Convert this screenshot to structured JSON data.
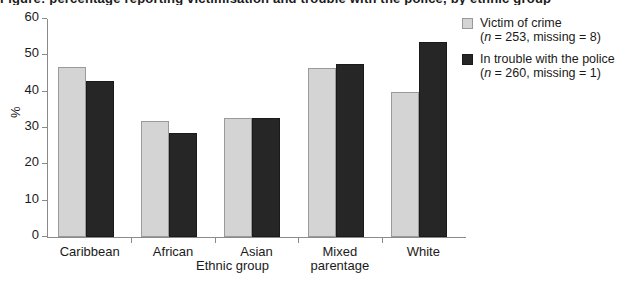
{
  "title_crop": "Figure: percentage reporting victimisation and trouble with the police, by ethnic group",
  "chart_data": {
    "type": "bar",
    "title": "",
    "xlabel": "Ethnic group",
    "ylabel": "%",
    "ylim": [
      0,
      60
    ],
    "yticks": [
      0,
      10,
      20,
      30,
      40,
      50,
      60
    ],
    "ytick_labels": [
      "0",
      "10",
      "20",
      "30",
      "40",
      "50",
      "60"
    ],
    "grid": false,
    "legend_position": "top-right",
    "categories": [
      "Caribbean",
      "African",
      "Asian",
      "Mixed parentage",
      "White"
    ],
    "category_lines": [
      [
        "Caribbean"
      ],
      [
        "African"
      ],
      [
        "Asian"
      ],
      [
        "Mixed",
        "parentage"
      ],
      [
        "White"
      ]
    ],
    "series": [
      {
        "name": "Victim of crime",
        "note": "(n = 253, missing = 8)",
        "color": "#d4d4d4",
        "values": [
          46.8,
          31.8,
          32.8,
          46.6,
          39.8
        ]
      },
      {
        "name": "In trouble with the police",
        "note": "(n = 260, missing = 1)",
        "color": "#262626",
        "values": [
          42.9,
          28.7,
          32.7,
          47.7,
          53.8
        ]
      }
    ]
  },
  "legend": {
    "entries": [
      {
        "label": "Victim of crime",
        "n_prefix": "(",
        "n_italic": "n",
        "n_rest": " = 253, missing = 8)",
        "swatch": "light-gray-swatch"
      },
      {
        "label": "In trouble with the police",
        "n_prefix": "(",
        "n_italic": "n",
        "n_rest": " = 260, missing = 1)",
        "swatch": "dark-swatch"
      }
    ]
  },
  "colors": {
    "series_light": "#d4d4d4",
    "series_dark": "#262626",
    "axis": "#8a8a8a",
    "text": "#1a1a1a",
    "background": "#ffffff"
  }
}
